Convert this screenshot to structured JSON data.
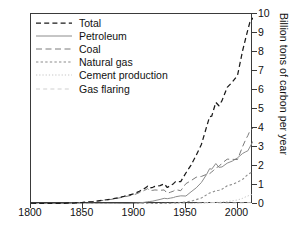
{
  "chart_data": {
    "type": "line",
    "title": "",
    "subtitle": "",
    "xlabel": "",
    "ylabel": "Billion tons of carbon per year",
    "xlim": [
      1800,
      2015
    ],
    "ylim": [
      0,
      10
    ],
    "grid": false,
    "legend_position": "top-left",
    "xticks": [
      1800,
      1850,
      1900,
      1950,
      2000
    ],
    "xtick_labels": [
      "1800",
      "1850",
      "1900",
      "1950",
      "2000"
    ],
    "yticks": [
      0,
      1,
      2,
      3,
      4,
      5,
      6,
      7,
      8,
      9,
      10
    ],
    "ytick_labels": [
      "0",
      "1",
      "2",
      "3",
      "4",
      "5",
      "6",
      "7",
      "8",
      "9",
      "10"
    ],
    "x": [
      1800,
      1810,
      1820,
      1830,
      1840,
      1850,
      1860,
      1870,
      1880,
      1890,
      1900,
      1905,
      1910,
      1913,
      1915,
      1918,
      1920,
      1925,
      1929,
      1932,
      1935,
      1938,
      1940,
      1945,
      1950,
      1955,
      1960,
      1965,
      1970,
      1973,
      1975,
      1979,
      1982,
      1985,
      1990,
      1995,
      2000,
      2005,
      2008,
      2010,
      2012,
      2015
    ],
    "series": [
      {
        "name": "Total",
        "style": "dashed",
        "color": "#1a1a1a",
        "values": [
          0.01,
          0.02,
          0.02,
          0.03,
          0.05,
          0.08,
          0.13,
          0.2,
          0.28,
          0.4,
          0.54,
          0.67,
          0.82,
          0.94,
          0.84,
          0.88,
          0.93,
          0.97,
          1.06,
          0.87,
          0.97,
          1.07,
          1.18,
          1.18,
          1.63,
          2.05,
          2.57,
          3.13,
          4.05,
          4.6,
          4.62,
          5.35,
          5.17,
          5.44,
          6.14,
          6.42,
          6.77,
          8.08,
          8.74,
          9.17,
          9.57,
          9.8
        ]
      },
      {
        "name": "Petroleum",
        "style": "solid",
        "color": "#8c8c8c",
        "values": [
          0,
          0,
          0,
          0,
          0,
          0,
          0.002,
          0.006,
          0.012,
          0.02,
          0.04,
          0.06,
          0.09,
          0.12,
          0.13,
          0.15,
          0.18,
          0.24,
          0.3,
          0.28,
          0.31,
          0.34,
          0.38,
          0.43,
          0.42,
          0.64,
          0.85,
          1.13,
          1.55,
          1.86,
          1.83,
          2.13,
          1.93,
          1.95,
          2.15,
          2.26,
          2.43,
          2.66,
          2.75,
          2.8,
          3.0,
          3.3
        ]
      },
      {
        "name": "Coal",
        "style": "dashed-long",
        "color": "#7a7a7a",
        "values": [
          0.01,
          0.02,
          0.02,
          0.03,
          0.05,
          0.08,
          0.12,
          0.19,
          0.26,
          0.37,
          0.49,
          0.6,
          0.72,
          0.81,
          0.7,
          0.72,
          0.74,
          0.72,
          0.74,
          0.56,
          0.62,
          0.68,
          0.76,
          0.7,
          1.07,
          1.23,
          1.41,
          1.45,
          1.56,
          1.6,
          1.68,
          1.9,
          1.98,
          2.15,
          2.36,
          2.35,
          2.34,
          3.03,
          3.4,
          3.6,
          3.85,
          4.0
        ]
      },
      {
        "name": "Natural gas",
        "style": "dotted-short",
        "color": "#8c8c8c",
        "values": [
          0,
          0,
          0,
          0,
          0,
          0,
          0,
          0,
          0,
          0.002,
          0.005,
          0.008,
          0.012,
          0.015,
          0.016,
          0.02,
          0.022,
          0.03,
          0.04,
          0.035,
          0.04,
          0.05,
          0.06,
          0.08,
          0.1,
          0.15,
          0.23,
          0.32,
          0.48,
          0.58,
          0.6,
          0.7,
          0.72,
          0.78,
          0.96,
          1.03,
          1.15,
          1.3,
          1.45,
          1.55,
          1.62,
          1.7
        ]
      },
      {
        "name": "Cement production",
        "style": "dotted",
        "color": "#c7c7c7",
        "values": [
          0,
          0,
          0,
          0,
          0,
          0,
          0,
          0,
          0,
          0,
          0.002,
          0.003,
          0.004,
          0.005,
          0.005,
          0.005,
          0.006,
          0.008,
          0.011,
          0.009,
          0.011,
          0.013,
          0.014,
          0.012,
          0.018,
          0.025,
          0.035,
          0.045,
          0.06,
          0.07,
          0.07,
          0.085,
          0.09,
          0.1,
          0.13,
          0.17,
          0.21,
          0.3,
          0.38,
          0.42,
          0.47,
          0.52
        ]
      },
      {
        "name": "Gas flaring",
        "style": "dashed-light",
        "color": "#cfcfcf",
        "values": [
          0,
          0,
          0,
          0,
          0,
          0,
          0,
          0,
          0,
          0,
          0,
          0,
          0.002,
          0.003,
          0.003,
          0.004,
          0.005,
          0.007,
          0.01,
          0.01,
          0.012,
          0.014,
          0.016,
          0.018,
          0.023,
          0.03,
          0.04,
          0.055,
          0.07,
          0.08,
          0.075,
          0.07,
          0.06,
          0.05,
          0.05,
          0.05,
          0.06,
          0.06,
          0.07,
          0.07,
          0.07,
          0.07
        ]
      }
    ]
  },
  "legend": {
    "items": [
      {
        "label": "Total"
      },
      {
        "label": "Petroleum"
      },
      {
        "label": "Coal"
      },
      {
        "label": "Natural gas"
      },
      {
        "label": "Cement production"
      },
      {
        "label": "Gas flaring"
      }
    ]
  }
}
